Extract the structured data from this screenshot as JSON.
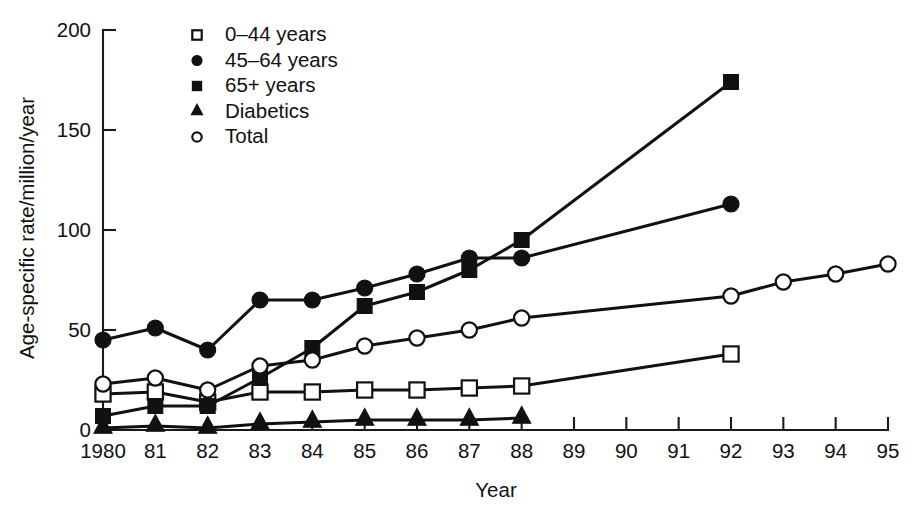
{
  "chart_data": {
    "type": "line",
    "title": "",
    "xlabel": "Year",
    "ylabel": "Age-specific rate/million/year",
    "xlim": [
      1980,
      1995
    ],
    "ylim": [
      0,
      200
    ],
    "yticks": [
      0,
      50,
      100,
      150,
      200
    ],
    "ytick_labels": [
      "0",
      "50",
      "100",
      "150",
      "200"
    ],
    "xticks": [
      1980,
      1981,
      1982,
      1983,
      1984,
      1985,
      1986,
      1987,
      1988,
      1989,
      1990,
      1991,
      1992,
      1993,
      1994,
      1995
    ],
    "xtick_labels": [
      "1980",
      "81",
      "82",
      "83",
      "84",
      "85",
      "86",
      "87",
      "88",
      "89",
      "90",
      "91",
      "92",
      "93",
      "94",
      "95"
    ],
    "grid": false,
    "legend_position": "top-left",
    "series": [
      {
        "name": "0–44 years",
        "marker": "open-square",
        "x": [
          1980,
          1981,
          1982,
          1983,
          1984,
          1985,
          1986,
          1987,
          1988,
          1992
        ],
        "values": [
          18,
          19,
          14,
          19,
          19,
          20,
          20,
          21,
          22,
          38
        ]
      },
      {
        "name": "45–64 years",
        "marker": "filled-circle",
        "x": [
          1980,
          1981,
          1982,
          1983,
          1984,
          1985,
          1986,
          1987,
          1988,
          1992
        ],
        "values": [
          45,
          51,
          40,
          65,
          65,
          71,
          78,
          86,
          86,
          113
        ]
      },
      {
        "name": "65+ years",
        "marker": "filled-square",
        "x": [
          1980,
          1981,
          1982,
          1983,
          1984,
          1985,
          1986,
          1987,
          1988,
          1992
        ],
        "values": [
          7,
          12,
          12,
          26,
          41,
          62,
          69,
          80,
          95,
          174
        ]
      },
      {
        "name": "Diabetics",
        "marker": "filled-triangle",
        "x": [
          1980,
          1981,
          1982,
          1983,
          1984,
          1985,
          1986,
          1987,
          1988
        ],
        "values": [
          1,
          2,
          1,
          3,
          4,
          5,
          5,
          5,
          6
        ]
      },
      {
        "name": "Total",
        "marker": "open-circle",
        "x": [
          1980,
          1981,
          1982,
          1983,
          1984,
          1985,
          1986,
          1987,
          1988,
          1992,
          1993,
          1994,
          1995
        ],
        "values": [
          23,
          26,
          20,
          32,
          35,
          42,
          46,
          50,
          56,
          67,
          74,
          78,
          83
        ]
      }
    ]
  }
}
